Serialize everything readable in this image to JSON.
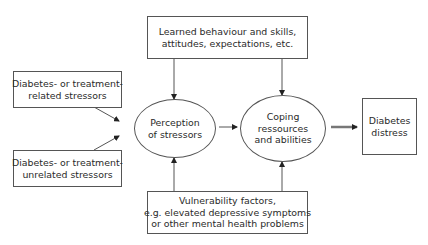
{
  "diagram": {
    "nodes": {
      "learned": {
        "lines": [
          "Learned behaviour and skills,",
          "attitudes, expectations, etc."
        ]
      },
      "related_stressors": {
        "lines": [
          "Diabetes- or treatment-",
          "related stressors"
        ]
      },
      "unrelated_stressors": {
        "lines": [
          "Diabetes- or treatment-",
          "unrelated stressors"
        ]
      },
      "perception": {
        "lines": [
          "Perception",
          "of stressors"
        ]
      },
      "coping": {
        "lines": [
          "Coping",
          "ressources",
          "and abilities"
        ]
      },
      "distress": {
        "lines": [
          "Diabetes",
          "distress"
        ]
      },
      "vulnerability": {
        "lines": [
          "Vulnerability factors,",
          "e.g. elevated depressive symptoms",
          "or other mental health problems"
        ]
      }
    },
    "edges": [
      {
        "from": "learned",
        "to": "perception"
      },
      {
        "from": "learned",
        "to": "coping"
      },
      {
        "from": "related_stressors",
        "to": "perception"
      },
      {
        "from": "unrelated_stressors",
        "to": "perception"
      },
      {
        "from": "vulnerability",
        "to": "perception"
      },
      {
        "from": "vulnerability",
        "to": "coping"
      },
      {
        "from": "perception",
        "to": "coping"
      },
      {
        "from": "coping",
        "to": "distress",
        "style": "thick"
      }
    ],
    "colors": {
      "stroke": "#555555",
      "text": "#2a2a2a",
      "thick_arrow": "#777777"
    }
  }
}
